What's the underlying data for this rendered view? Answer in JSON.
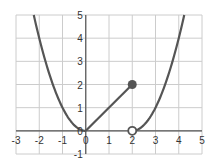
{
  "chart_data": {
    "type": "line",
    "title": "",
    "xlabel": "",
    "ylabel": "",
    "xlim": [
      -3,
      5
    ],
    "ylim": [
      -1,
      5
    ],
    "grid": true,
    "legend": null,
    "x_ticks": [
      "-3",
      "-2",
      "-1",
      "0",
      "1",
      "2",
      "3",
      "4",
      "5"
    ],
    "y_ticks": [
      "5",
      "4",
      "3",
      "2",
      "1",
      "0",
      "-1"
    ],
    "series": [
      {
        "name": "left-parabola",
        "description": "y = x^2 for x <= 0",
        "points": [
          [
            -2.24,
            5
          ],
          [
            -2,
            4
          ],
          [
            -1.5,
            2.25
          ],
          [
            -1,
            1
          ],
          [
            -0.5,
            0.25
          ],
          [
            0,
            0
          ]
        ]
      },
      {
        "name": "line-segment",
        "description": "y = x for 0 <= x <= 2",
        "points": [
          [
            0,
            0
          ],
          [
            2,
            2
          ]
        ]
      },
      {
        "name": "right-parabola",
        "description": "y = (x-2)^2 for x > 2",
        "points": [
          [
            2,
            0
          ],
          [
            2.5,
            0.25
          ],
          [
            3,
            1
          ],
          [
            3.5,
            2.25
          ],
          [
            4,
            4
          ],
          [
            4.24,
            5
          ]
        ]
      }
    ],
    "markers": [
      {
        "x": 2,
        "y": 2,
        "style": "filled"
      },
      {
        "x": 2,
        "y": 0,
        "style": "open"
      }
    ],
    "colors": {
      "curve": "#555555",
      "grid": "#cccccc",
      "axis": "#555555"
    }
  }
}
